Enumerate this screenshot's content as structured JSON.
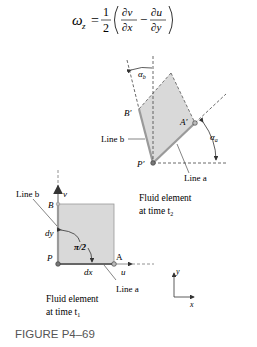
{
  "equation": {
    "lhs": "ω",
    "lhs_sub": "z",
    "equals": "=",
    "frac_num": "1",
    "frac_den": "2",
    "term1_num": "∂v",
    "term1_den": "∂x",
    "minus": "−",
    "term2_num": "∂u",
    "term2_den": "∂y"
  },
  "deformed_element": {
    "alpha_b": "α",
    "alpha_b_sub": "b",
    "alpha_a": "α",
    "alpha_a_sub": "a",
    "B_prime": "B′",
    "A_prime": "A′",
    "P_prime": "P′",
    "line_b": "Line b",
    "line_a": "Line a",
    "caption_line1": "Fluid element",
    "caption_line2": "at time t",
    "caption_sub": "2"
  },
  "original_element": {
    "line_b": "Line b",
    "v_axis": "v",
    "B": "B",
    "dy": "dy",
    "angle": "π/2",
    "P": "P",
    "A": "A",
    "u_axis": "u",
    "dx": "dx",
    "line_a": "Line a",
    "caption_line1": "Fluid element",
    "caption_line2": "at time t",
    "caption_sub": "1"
  },
  "axes_icon": {
    "y": "y",
    "x": "x"
  },
  "figure_label": "FIGURE P4–69",
  "colors": {
    "fill": "#d9d9d9",
    "edge": "#9a9a9a",
    "text": "#333333",
    "figure_label": "#555555"
  }
}
